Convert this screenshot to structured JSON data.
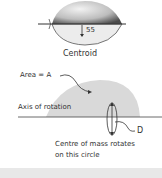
{
  "top_figure": {
    "measurement_label": "55",
    "caption": "Centroid"
  },
  "bottom_figure": {
    "area_label": "Area = A",
    "axis_label": "Axis of rotation",
    "distance_label": "D",
    "caption_line1": "Centre of mass rotates",
    "caption_line2": "on this circle"
  },
  "colors": {
    "shape_fill": "#dcdcdc",
    "shape_shadow": "#555555",
    "line": "#333333",
    "band": "#e8e8e8"
  }
}
